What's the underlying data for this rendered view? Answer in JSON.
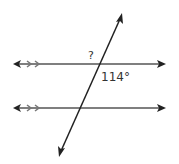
{
  "diagram": {
    "labels": {
      "unknown_angle": "?",
      "given_angle": "114°"
    },
    "colors": {
      "line": "#555555",
      "transversal": "#222222",
      "text": "#333333"
    },
    "parallel_lines": [
      {
        "y": 64,
        "x1": 13,
        "x2": 166,
        "hash_marks": 2
      },
      {
        "y": 108,
        "x1": 13,
        "x2": 166,
        "hash_marks": 2
      }
    ],
    "transversal": {
      "x1": 59,
      "y1": 157,
      "x2": 122,
      "y2": 13
    }
  }
}
